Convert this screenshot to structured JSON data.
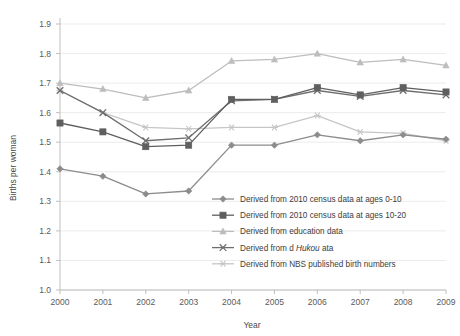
{
  "chart_data": {
    "type": "line",
    "title": "",
    "xlabel": "Year",
    "ylabel": "Births per woman",
    "categories": [
      "2000",
      "2001",
      "2002",
      "2003",
      "2004",
      "2005",
      "2006",
      "2007",
      "2008",
      "2009"
    ],
    "x": [
      2000,
      2001,
      2002,
      2003,
      2004,
      2005,
      2006,
      2007,
      2008,
      2009
    ],
    "xlim": [
      2000,
      2009
    ],
    "ylim": [
      1.0,
      1.9
    ],
    "yticks": [
      "1.0",
      "1.1",
      "1.2",
      "1.3",
      "1.4",
      "1.5",
      "1.6",
      "1.7",
      "1.8",
      "1.9"
    ],
    "ytick_values": [
      1.0,
      1.1,
      1.2,
      1.3,
      1.4,
      1.5,
      1.6,
      1.7,
      1.8,
      1.9
    ],
    "grid": "horizontal",
    "legend_position": "inside-bottom-right",
    "series": [
      {
        "name": "Derived from 2010 census data at ages 0-10",
        "marker": "diamond",
        "color": "#8c8c8c",
        "values": [
          1.41,
          1.385,
          1.325,
          1.335,
          1.49,
          1.49,
          1.525,
          1.505,
          1.525,
          1.51
        ]
      },
      {
        "name": "Derived from 2010 census data at ages 10-20",
        "marker": "square",
        "color": "#5f5f5f",
        "values": [
          1.565,
          1.535,
          1.485,
          1.49,
          1.645,
          1.645,
          1.685,
          1.66,
          1.685,
          1.67
        ]
      },
      {
        "name": "Derived from education data",
        "marker": "triangle",
        "color": "#bdbdbd",
        "values": [
          1.7,
          1.68,
          1.65,
          1.675,
          1.775,
          1.78,
          1.8,
          1.77,
          1.78,
          1.76
        ]
      },
      {
        "name_parts": [
          "Derived from d ",
          "Hukou",
          " ata"
        ],
        "name": "Derived from d Hukou ata",
        "marker": "cross",
        "color": "#6e6e6e",
        "values": [
          1.675,
          1.6,
          1.505,
          1.515,
          1.64,
          1.645,
          1.675,
          1.655,
          1.675,
          1.66
        ]
      },
      {
        "name": "Derived from NBS published birth numbers",
        "marker": "asterisk",
        "color": "#c6c6c6",
        "values": [
          1.675,
          1.6,
          1.55,
          1.545,
          1.55,
          1.55,
          1.59,
          1.535,
          1.53,
          1.505
        ]
      }
    ]
  },
  "axis": {
    "y_title": "Births per woman",
    "x_title": "Year"
  }
}
